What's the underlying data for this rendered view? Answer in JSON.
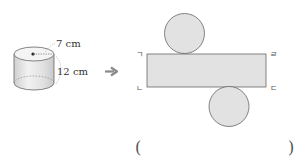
{
  "problem": {
    "top_text_cut": "",
    "cylinder": {
      "radius_label": "7 cm",
      "height_label": "12 cm"
    },
    "arrow": "➔",
    "net": {
      "corner_labels": {
        "top_left": "ㄱ",
        "bottom_left": "ㄴ",
        "top_right": "ㄹ",
        "bottom_right": "ㄷ"
      }
    },
    "answer": {
      "open_paren": "(",
      "close_paren": ")",
      "value": ""
    }
  },
  "colors": {
    "shape_fill": "#e2e2e2",
    "stroke": "#666666",
    "arrow": "#8a8a8a"
  }
}
